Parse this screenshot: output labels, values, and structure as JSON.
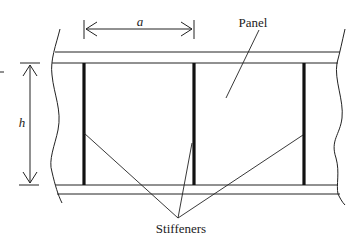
{
  "diagram": {
    "type": "stiffened-plate-girder-web",
    "labels": {
      "panel": "Panel",
      "stiffeners": "Stiffeners",
      "spacing": "a",
      "height": "h"
    },
    "colors": {
      "line": "#222222",
      "background": "#ffffff"
    },
    "stiffener_count": 3
  }
}
